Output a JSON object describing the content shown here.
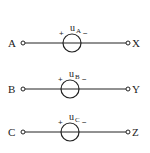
{
  "diagram": {
    "type": "three-phase voltage sources",
    "stroke_color": "#222222",
    "sources": [
      {
        "start_terminal": "A",
        "end_terminal": "X",
        "symbol": "u",
        "subscript": "A",
        "plus": "+",
        "minus": "−",
        "y": 43
      },
      {
        "start_terminal": "B",
        "end_terminal": "Y",
        "symbol": "u",
        "subscript": "B",
        "plus": "+",
        "minus": "−",
        "y": 89
      },
      {
        "start_terminal": "C",
        "end_terminal": "Z",
        "symbol": "u",
        "subscript": "C",
        "plus": "+",
        "minus": "−",
        "y": 132
      }
    ]
  }
}
